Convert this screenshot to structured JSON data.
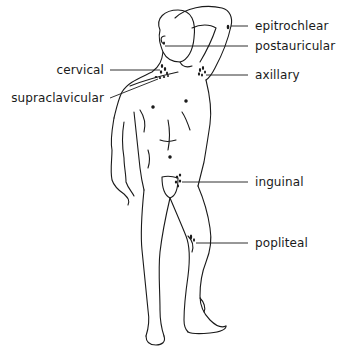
{
  "diagram": {
    "colors": {
      "ink": "#1a1a1a",
      "background": "#ffffff"
    },
    "labels": [
      {
        "id": "epitrochlear",
        "text": "epitrochlear",
        "side": "right",
        "x": 255,
        "y": 19
      },
      {
        "id": "postauricular",
        "text": "postauricular",
        "side": "right",
        "x": 255,
        "y": 39
      },
      {
        "id": "cervical",
        "text": "cervical",
        "side": "left",
        "x": 103,
        "y": 63
      },
      {
        "id": "axillary",
        "text": "axillary",
        "side": "right",
        "x": 255,
        "y": 68
      },
      {
        "id": "supraclavicular",
        "text": "supraclavicular",
        "side": "left",
        "x": 103,
        "y": 91
      },
      {
        "id": "inguinal",
        "text": "inguinal",
        "side": "right",
        "x": 255,
        "y": 175
      },
      {
        "id": "popliteal",
        "text": "popliteal",
        "side": "right",
        "x": 255,
        "y": 236
      }
    ]
  }
}
